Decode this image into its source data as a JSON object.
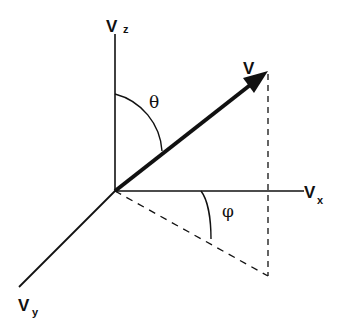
{
  "diagram": {
    "type": "3d-vector-spherical-coordinates",
    "axes": [
      {
        "id": "z",
        "label": "V",
        "subscript": "z",
        "direction": "up"
      },
      {
        "id": "x",
        "label": "V",
        "subscript": "x",
        "direction": "right"
      },
      {
        "id": "y",
        "label": "V",
        "subscript": "y",
        "direction": "down-left"
      }
    ],
    "vector": {
      "label": "V"
    },
    "angles": [
      {
        "id": "theta",
        "symbol": "θ",
        "between": "V_z axis and V"
      },
      {
        "id": "phi",
        "symbol": "φ",
        "between": "V_x axis and projection of V in x-y plane"
      }
    ],
    "colors": {
      "stroke": "#111111",
      "background": "#ffffff"
    }
  }
}
